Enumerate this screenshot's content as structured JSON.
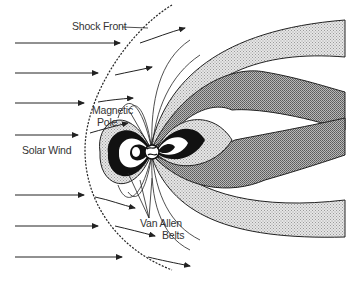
{
  "diagram": {
    "labels": {
      "shock_front": "Shock Front",
      "magnetic_pole": "Magnetic",
      "magnetic_pole_2": "Pole",
      "solar_wind": "Solar Wind",
      "van_allen": "Van Allen",
      "van_allen_2": "Belts"
    },
    "colors": {
      "ink": "#1a1a1a",
      "light_stipple": "#d9d9d9",
      "dark_hatch": "#8a8a8a",
      "belt_black": "#111111"
    }
  }
}
